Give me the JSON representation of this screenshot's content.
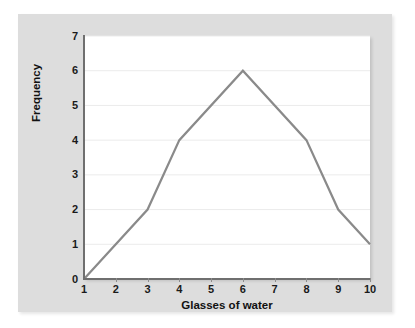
{
  "chart_data": {
    "type": "line",
    "title": "",
    "xlabel": "Glasses of water",
    "ylabel": "Frequency",
    "xlim": [
      1,
      10
    ],
    "ylim": [
      0,
      7
    ],
    "xticks": [
      1,
      2,
      3,
      4,
      5,
      6,
      7,
      8,
      9,
      10
    ],
    "yticks": [
      0,
      1,
      2,
      3,
      4,
      5,
      6,
      7
    ],
    "grid": "horizontal",
    "legend": null,
    "series": [
      {
        "name": "Frequency",
        "color": "#8a8a8a",
        "x": [
          1,
          3,
          4,
          6,
          8,
          9,
          10
        ],
        "values": [
          0,
          2,
          4,
          6,
          4,
          2,
          1
        ]
      }
    ]
  },
  "axes": {
    "x_title": "Glasses of water",
    "y_title": "Frequency",
    "x_tick_labels": [
      "1",
      "2",
      "3",
      "4",
      "5",
      "6",
      "7",
      "8",
      "9",
      "10"
    ],
    "y_tick_labels": [
      "0",
      "1",
      "2",
      "3",
      "4",
      "5",
      "6",
      "7"
    ]
  },
  "colors": {
    "page_background": "#ffffff",
    "panel_background": "#dddddd",
    "plot_background": "#ffffff",
    "gridline": "#ebebeb",
    "axis_line": "#6f6f6f",
    "series_line": "#8a8a8a",
    "text": "#111111"
  }
}
